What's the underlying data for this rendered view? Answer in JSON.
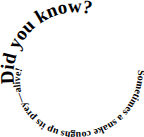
{
  "spiral": {
    "heading": "Did you know?",
    "body": "Sometimes a snake coughs up its prey—alive!",
    "full_text": "Did you know?Sometimes a snake coughs up its prey—alive!"
  },
  "colors": {
    "text": "#000000",
    "background": "#ffffff"
  }
}
